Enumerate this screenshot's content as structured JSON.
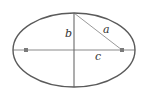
{
  "diagram": {
    "canvas": {
      "width": 145,
      "height": 95,
      "background": "#ffffff"
    },
    "ellipse": {
      "cx": 74,
      "cy": 50,
      "rx": 61,
      "ry": 37,
      "stroke": "#5a5a5a",
      "stroke_width": 1.4
    },
    "major_axis": {
      "x1": 13,
      "y1": 50,
      "x2": 135,
      "y2": 50,
      "stroke": "#8a8a8a"
    },
    "minor_axis": {
      "x1": 74,
      "y1": 13,
      "x2": 74,
      "y2": 87,
      "stroke": "#6a6a6a"
    },
    "hypotenuse": {
      "x1": 74,
      "y1": 13,
      "x2": 122,
      "y2": 50,
      "stroke": "#9a9a9a"
    },
    "foci": [
      {
        "name": "left-focus",
        "cx": 26,
        "cy": 50,
        "r": 2
      },
      {
        "name": "right-focus",
        "cx": 122,
        "cy": 50,
        "r": 2
      }
    ],
    "focus_color": "#7a7a7a",
    "labels": {
      "a": "a",
      "b": "b",
      "c": "c"
    },
    "label_positions": {
      "a": {
        "x": 104,
        "y": 33
      },
      "b": {
        "x": 65,
        "y": 36
      },
      "c": {
        "x": 95,
        "y": 60
      }
    }
  }
}
